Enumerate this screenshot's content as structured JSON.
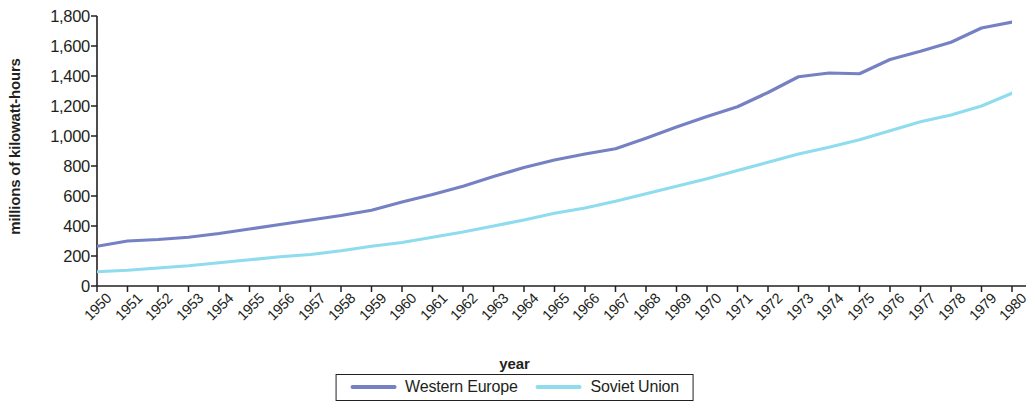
{
  "chart_data": {
    "type": "line",
    "title": "",
    "xlabel": "year",
    "ylabel": "millions of kilowatt-hours",
    "xlim": [
      1950,
      1980
    ],
    "ylim": [
      0,
      1800
    ],
    "grid": false,
    "legend_position": "bottom",
    "y_ticks": [
      1800,
      1600,
      1400,
      1200,
      1000,
      800,
      600,
      400,
      200,
      0
    ],
    "y_tick_labels": [
      "1,800",
      "1,600",
      "1,400",
      "1,200",
      "1,000",
      "800",
      "600",
      "400",
      "200",
      "0"
    ],
    "x": [
      1950,
      1951,
      1952,
      1953,
      1954,
      1955,
      1956,
      1957,
      1958,
      1959,
      1960,
      1961,
      1962,
      1963,
      1964,
      1965,
      1966,
      1967,
      1968,
      1969,
      1970,
      1971,
      1972,
      1973,
      1974,
      1975,
      1976,
      1977,
      1978,
      1979,
      1980
    ],
    "x_tick_labels": [
      "1950",
      "1951",
      "1952",
      "1953",
      "1954",
      "1955",
      "1956",
      "1957",
      "1958",
      "1959",
      "1960",
      "1961",
      "1962",
      "1963",
      "1964",
      "1965",
      "1966",
      "1967",
      "1968",
      "1969",
      "1970",
      "1971",
      "1972",
      "1973",
      "1974",
      "1975",
      "1976",
      "1977",
      "1978",
      "1979",
      "1980"
    ],
    "series": [
      {
        "name": "Western Europe",
        "color": "#7681c4",
        "values": [
          265,
          300,
          310,
          325,
          350,
          380,
          410,
          440,
          470,
          505,
          560,
          610,
          665,
          730,
          790,
          840,
          880,
          915,
          985,
          1060,
          1130,
          1195,
          1290,
          1395,
          1420,
          1415,
          1510,
          1565,
          1625,
          1720,
          1760
        ]
      },
      {
        "name": "Soviet Union",
        "color": "#8fdcee",
        "values": [
          95,
          105,
          120,
          135,
          155,
          175,
          195,
          210,
          235,
          265,
          290,
          325,
          360,
          400,
          440,
          485,
          520,
          565,
          615,
          665,
          715,
          770,
          825,
          880,
          925,
          975,
          1035,
          1095,
          1140,
          1200,
          1285
        ]
      }
    ]
  },
  "legend": {
    "entries": [
      {
        "label": "Western Europe",
        "color": "#7681c4"
      },
      {
        "label": "Soviet Union",
        "color": "#8fdcee"
      }
    ]
  },
  "axis": {
    "x_title": "year",
    "y_title": "millions of kilowatt-hours"
  }
}
